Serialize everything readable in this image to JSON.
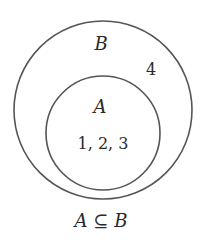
{
  "diagram": {
    "type": "venn-subset",
    "outer_set": {
      "name": "B",
      "elements_outside_inner": "4",
      "stroke_color": "#555555"
    },
    "inner_set": {
      "name": "A",
      "elements": "1, 2, 3",
      "stroke_color": "#555555"
    },
    "caption": {
      "left": "A",
      "symbol": "⊆",
      "right": "B"
    }
  }
}
